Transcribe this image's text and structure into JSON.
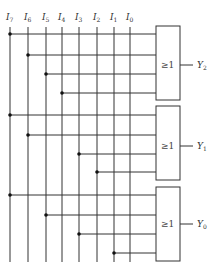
{
  "diagram": {
    "type": "logic-circuit",
    "inputs": [
      {
        "label": "I",
        "sub": "7",
        "x": 10
      },
      {
        "label": "I",
        "sub": "6",
        "x": 28
      },
      {
        "label": "I",
        "sub": "5",
        "x": 46
      },
      {
        "label": "I",
        "sub": "4",
        "x": 62
      },
      {
        "label": "I",
        "sub": "3",
        "x": 79
      },
      {
        "label": "I",
        "sub": "2",
        "x": 97
      },
      {
        "label": "I",
        "sub": "1",
        "x": 114
      },
      {
        "label": "I",
        "sub": "0",
        "x": 130
      }
    ],
    "gates": [
      {
        "symbol": "≥1",
        "output": "Y",
        "output_sub": "2",
        "top": 26,
        "bottom": 100,
        "out_y": 65,
        "connections": [
          {
            "input": "I7",
            "y": 34
          },
          {
            "input": "I6",
            "y": 55
          },
          {
            "input": "I5",
            "y": 74
          },
          {
            "input": "I4",
            "y": 93
          }
        ]
      },
      {
        "symbol": "≥1",
        "output": "Y",
        "output_sub": "1",
        "top": 106,
        "bottom": 180,
        "out_y": 146,
        "connections": [
          {
            "input": "I7",
            "y": 115
          },
          {
            "input": "I6",
            "y": 135
          },
          {
            "input": "I3",
            "y": 154
          },
          {
            "input": "I2",
            "y": 172
          }
        ]
      },
      {
        "symbol": "≥1",
        "output": "Y",
        "output_sub": "0",
        "top": 187,
        "bottom": 261,
        "out_y": 224,
        "connections": [
          {
            "input": "I7",
            "y": 195
          },
          {
            "input": "I5",
            "y": 215
          },
          {
            "input": "I3",
            "y": 234
          },
          {
            "input": "I1",
            "y": 253
          }
        ]
      }
    ]
  }
}
